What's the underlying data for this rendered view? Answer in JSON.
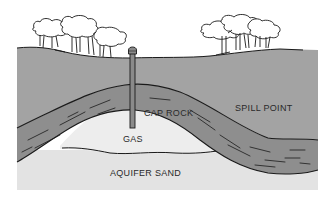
{
  "diagram": {
    "kind": "geologic cross-section of underground gas storage reservoir",
    "labels": {
      "cap_rock": "CAP ROCK",
      "spill_point": "SPILL POINT",
      "gas": "GAS",
      "aquifer_sand": "AQUIFER SAND"
    },
    "layers": [
      {
        "name": "overburden",
        "color": "#a3a3a3"
      },
      {
        "name": "cap-rock",
        "color": "#8e8e8e"
      },
      {
        "name": "gas",
        "color": "#ececec"
      },
      {
        "name": "aquifer-sand",
        "color": "#e3e3e3"
      }
    ],
    "features": [
      "well",
      "tree-cluster-left",
      "tree-cluster-right"
    ],
    "colors": {
      "outline": "#1a1a1a",
      "text": "#2a2a2a"
    }
  }
}
